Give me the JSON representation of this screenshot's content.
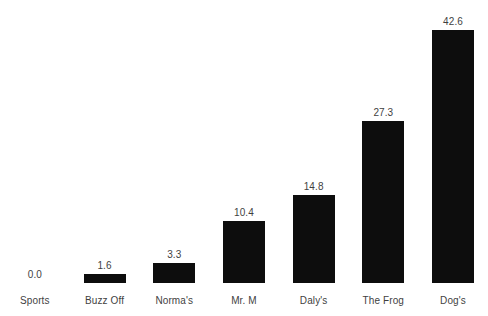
{
  "chart_data": {
    "type": "bar",
    "title": "",
    "subtitle": "",
    "xlabel": "",
    "ylabel": "",
    "categories": [
      "Sports",
      "Buzz Off",
      "Norma's",
      "Mr. M",
      "Daly's",
      "The Frog",
      "Dog's"
    ],
    "values": [
      0.0,
      1.6,
      3.3,
      10.4,
      14.8,
      27.3,
      42.6
    ],
    "value_labels": [
      "0.0",
      "1.6",
      "3.3",
      "10.4",
      "14.8",
      "27.3",
      "42.6"
    ],
    "series": [
      {
        "name": "",
        "values": [
          0.0,
          1.6,
          3.3,
          10.4,
          14.8,
          27.3,
          42.6
        ]
      }
    ],
    "ylim": [
      0,
      42.6
    ],
    "grid": false,
    "legend": false,
    "legend_position": "none",
    "data_labels": true,
    "axis_lines": false,
    "tick_labels_y": [],
    "bar_color": "#0d0d0d",
    "label_color": "#3f3f3f",
    "background_color": "#ffffff"
  }
}
